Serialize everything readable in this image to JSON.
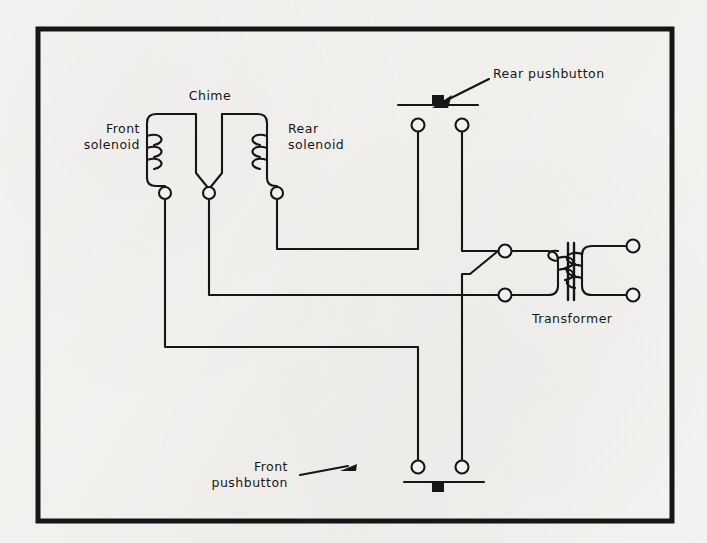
{
  "diagram": {
    "background_color": "#f3f1ef",
    "ink_color": "#161616",
    "border": {
      "x": 38,
      "y": 29,
      "width": 634,
      "height": 492,
      "stroke_width": 5
    },
    "labels": {
      "chime": "Chime",
      "front_solenoid_line1": "Front",
      "front_solenoid_line2": "solenoid",
      "rear_solenoid_line1": "Rear",
      "rear_solenoid_line2": "solenoid",
      "transformer": "Transformer",
      "rear_pushbutton": "Rear pushbutton",
      "front_pushbutton_line1": "Front",
      "front_pushbutton_line2": "pushbutton"
    },
    "components": [
      {
        "name": "front-solenoid",
        "type": "solenoid-coil",
        "turns": 3,
        "terminal": {
          "x": 165,
          "y": 193
        }
      },
      {
        "name": "chime",
        "type": "chime-junction",
        "terminal": {
          "x": 209,
          "y": 193
        }
      },
      {
        "name": "rear-solenoid",
        "type": "solenoid-coil",
        "turns": 3,
        "terminal": {
          "x": 277,
          "y": 193
        }
      },
      {
        "name": "rear-pushbutton",
        "type": "normally-open-switch",
        "terminals": [
          {
            "x": 418,
            "y": 125
          },
          {
            "x": 462,
            "y": 125
          }
        ]
      },
      {
        "name": "front-pushbutton",
        "type": "normally-open-switch",
        "terminals": [
          {
            "x": 418,
            "y": 467
          },
          {
            "x": 462,
            "y": 467
          }
        ]
      },
      {
        "name": "transformer",
        "type": "transformer",
        "turns_primary": 3,
        "turns_secondary": 3,
        "terminals": [
          {
            "x": 505,
            "y": 251
          },
          {
            "x": 505,
            "y": 295
          },
          {
            "x": 633,
            "y": 246
          },
          {
            "x": 633,
            "y": 295
          }
        ]
      }
    ]
  }
}
